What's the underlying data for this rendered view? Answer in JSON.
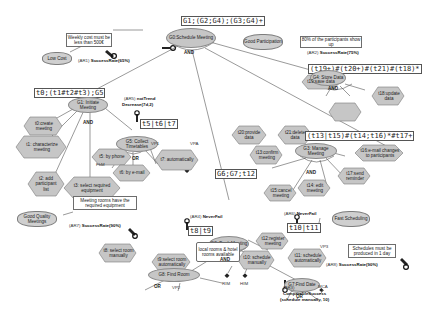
{
  "goals": {
    "g0": "G0:Schedule Meeting",
    "g1": "G1: Initiate Meeting",
    "g2": "G2: Book Meeting",
    "g3": "G3: Manage Meeting",
    "g4": "G4: Store Data",
    "g5": "G5: Collect Timetables",
    "g7": "G7:Find Date",
    "g8": "G8: Find Room"
  },
  "expressions": {
    "g0": "G1;(G2;G4);(G3;G4)+",
    "g1": "t0;(t1#t2#t3);G5",
    "g5": "t5|t6|t7",
    "g2": "G6;G7;t12",
    "g3": "(t13|t15)#(t14;t16)*#t17+",
    "g4": "(t19+)#(t20+)#(t21)#(t18)*",
    "g8": "t8|t9",
    "g7": "t10|t11"
  },
  "tasks": {
    "t0": "t0:create meeting",
    "t1": "t1: characterize meeting",
    "t2": "t2: add participant list",
    "t3": "t3: select required equipment",
    "t5": "t5: by phone",
    "t6": "t6: by e-mail",
    "t7": "t7: automatically",
    "t8": "t8: select room manually",
    "t9": "t9:select room automatically",
    "t10": "t10: schedule manually",
    "t11": "t11: schedule automatically",
    "t12": "t12:register meeting",
    "t13": "t13:confirm meeting",
    "t14": "t14: edit meeting",
    "t15": "t15:cancel meeting",
    "t16": "t16:e-mail changes to participants",
    "t17": "t17:send reminder",
    "t18": "t18:update data",
    "t19": "t19:save data",
    "t20": "t20:provide data",
    "t21": "t21:delete data"
  },
  "softgoals": {
    "low_cost": "Low Cost",
    "good_participation": "Good Participation",
    "good_quality": "Good Quality Meetings",
    "fast_scheduling": "Fast Scheduling"
  },
  "notes": {
    "weekly_cost": "Weekly cost must be less than 500€",
    "participants": "80% of the participants show up",
    "rooms_equipment": "Meeting rooms have the required equipment",
    "schedules_day": "Schedules must be produced in 1 day",
    "rooms_available": "local rooms & hotel rooms available"
  },
  "awareness": {
    "ar1_id": "(AR1)",
    "ar1": "SuccessRate(65%)",
    "ar2_id": "(AR2)",
    "ar2": "SuccessRate(75%)",
    "ar3_id": "(AR3)",
    "ar3": "ComparableSuccess",
    "ar3_detail": "(schedule manually, 10)",
    "ar4_id": "(AR4)",
    "ar4": "NeverFail",
    "ar5_id": "(AR5)",
    "ar5": "notTrend",
    "ar5_detail": "Decrease(7d,2)",
    "ar6_id": "(AR6)",
    "ar6": "NeverFail",
    "ar7_id": "(AR7)",
    "ar7": "SuccessRate(90%)",
    "ar8_id": "(AR8)",
    "ar8": "SuccessRate(90%)"
  },
  "operators": {
    "and": "AND",
    "or": "OR"
  },
  "params": {
    "fhm": "FhM",
    "vp1": "VP1",
    "vpa": "VPA",
    "vp2": "VP2",
    "vp3": "VP3",
    "rim": "RIM",
    "him": "HIM",
    "mca": "MCA"
  }
}
